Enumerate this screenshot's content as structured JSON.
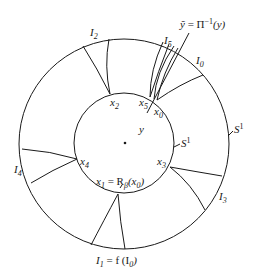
{
  "figure": {
    "outer_circle_label": "S",
    "outer_circle_label_sup": "1",
    "inner_circle_label": "S",
    "inner_circle_label_sup": "1",
    "top_annotation": {
      "lhs": "ỹ",
      "eq": " = ",
      "pi": "Π",
      "sup": "−1",
      "arg": "(y)"
    },
    "intervals": [
      {
        "name": "I",
        "sub": "0"
      },
      {
        "name": "I",
        "sub": "1",
        "suffix": " = f (I",
        "suffix_sub": "0",
        "suffix_end": ")"
      },
      {
        "name": "I",
        "sub": "2"
      },
      {
        "name": "I",
        "sub": "3"
      },
      {
        "name": "I",
        "sub": "4"
      },
      {
        "name": "I",
        "sub": "5"
      }
    ],
    "points": [
      {
        "name": "x",
        "sub": "0"
      },
      {
        "name": "x",
        "sub": "1",
        "suffix": " = R",
        "suffix_sub": "β",
        "suffix_end": "(x",
        "suffix_end_sub": "0",
        "close": ")"
      },
      {
        "name": "x",
        "sub": "2"
      },
      {
        "name": "x",
        "sub": "3"
      },
      {
        "name": "x",
        "sub": "4"
      },
      {
        "name": "x",
        "sub": "5"
      }
    ],
    "y_label": "y"
  }
}
